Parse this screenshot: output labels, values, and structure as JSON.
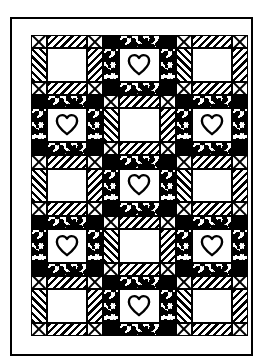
{
  "frame": {
    "outline_color": "#000000",
    "border_fabric": "#ffffff",
    "border_name": "plain white sashing border"
  },
  "grid": {
    "columns": 3,
    "rows": 5,
    "block_count": 15,
    "sashing_color": "#000000"
  },
  "fabrics": [
    {
      "key": "white",
      "name": "plain white",
      "color": "#ffffff"
    },
    {
      "key": "black",
      "name": "solid black",
      "color": "#000000"
    },
    {
      "key": "hatch",
      "name": "diagonal stripe",
      "color": "#000000"
    },
    {
      "key": "speck",
      "name": "speckled calico",
      "color": "#000000"
    },
    {
      "key": "x",
      "name": "crossed triangles",
      "color": "#000000"
    }
  ],
  "block_types": {
    "sawtooth": {
      "name": "Sawtooth Star block",
      "corner": "x",
      "edge": "hatch",
      "center": "white",
      "motif": "none"
    },
    "heart": {
      "name": "Heart block",
      "corner": "black",
      "edge": "speck",
      "center": "white",
      "motif": "heart-outline"
    }
  },
  "blocks": [
    {
      "row": 1,
      "col": 1,
      "type": "sawtooth"
    },
    {
      "row": 1,
      "col": 2,
      "type": "heart"
    },
    {
      "row": 1,
      "col": 3,
      "type": "sawtooth"
    },
    {
      "row": 2,
      "col": 1,
      "type": "heart"
    },
    {
      "row": 2,
      "col": 2,
      "type": "sawtooth"
    },
    {
      "row": 2,
      "col": 3,
      "type": "heart"
    },
    {
      "row": 3,
      "col": 1,
      "type": "sawtooth"
    },
    {
      "row": 3,
      "col": 2,
      "type": "heart"
    },
    {
      "row": 3,
      "col": 3,
      "type": "sawtooth"
    },
    {
      "row": 4,
      "col": 1,
      "type": "heart"
    },
    {
      "row": 4,
      "col": 2,
      "type": "sawtooth"
    },
    {
      "row": 4,
      "col": 3,
      "type": "heart"
    },
    {
      "row": 5,
      "col": 1,
      "type": "sawtooth"
    },
    {
      "row": 5,
      "col": 2,
      "type": "heart"
    },
    {
      "row": 5,
      "col": 3,
      "type": "sawtooth"
    }
  ],
  "heart_path": "M50 88 C22 66 8 50 8 33 C8 18 19 9 31 9 C40 9 46 14 50 21 C54 14 60 9 69 9 C81 9 92 18 92 33 C92 50 78 66 50 88 Z"
}
